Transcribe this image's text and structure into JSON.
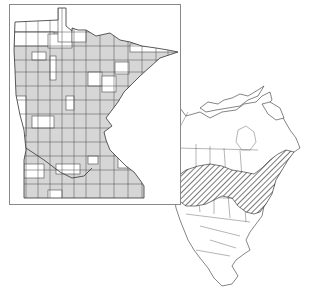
{
  "figure": {
    "type": "species distribution map",
    "state_inset": {
      "region": "Minnesota",
      "legend": "gray counties = recorded presence",
      "present_color": "#d6d6d6",
      "absent_color": "#ffffff",
      "frame_color": "#888888"
    },
    "continental_map": {
      "region": "North America",
      "range_pattern": "diagonal hatching",
      "range_description": "southern Canada and northern/north-central United States, from the Rockies east to the Atlantic"
    }
  }
}
